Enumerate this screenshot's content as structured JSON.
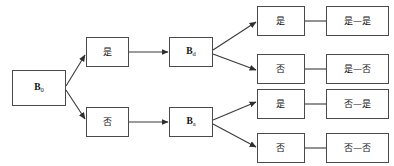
{
  "diagram": {
    "type": "binary-decision-tree",
    "title": "",
    "orientation": "left-to-right",
    "background_color": "#ffffff",
    "box_border_color": "#4a4a4a",
    "edge_color": "#3a3a3a",
    "text_color": "#111111",
    "nodes": {
      "root": {
        "id": "root",
        "base": "B",
        "subscript": "0",
        "label": "B0",
        "column": 1
      },
      "level1": [
        {
          "id": "l1-yes",
          "label": "是",
          "meaning": "yes",
          "column": 2
        },
        {
          "id": "l1-no",
          "label": "否",
          "meaning": "no",
          "column": 2
        }
      ],
      "level2": [
        {
          "id": "l2-upper",
          "base": "B",
          "subscript": "d",
          "label": "Bd",
          "column": 3
        },
        {
          "id": "l2-lower",
          "base": "B",
          "subscript": "a",
          "label": "Ba",
          "column": 3
        }
      ],
      "level3": [
        {
          "id": "l3-1",
          "label": "是",
          "meaning": "yes",
          "column": 4
        },
        {
          "id": "l3-2",
          "label": "否",
          "meaning": "no",
          "column": 4
        },
        {
          "id": "l3-3",
          "label": "是",
          "meaning": "yes",
          "column": 4
        },
        {
          "id": "l3-4",
          "label": "否",
          "meaning": "no",
          "column": 4
        }
      ],
      "outcomes": [
        {
          "id": "out-1",
          "label": "是—是",
          "column": 5
        },
        {
          "id": "out-2",
          "label": "是—否",
          "column": 5
        },
        {
          "id": "out-3",
          "label": "否—是",
          "column": 5
        },
        {
          "id": "out-4",
          "label": "否—否",
          "column": 5
        }
      ]
    },
    "edges": [
      {
        "from": "root",
        "to": "l1-yes",
        "style": "arrow",
        "direction": "diagonal-up"
      },
      {
        "from": "root",
        "to": "l1-no",
        "style": "arrow",
        "direction": "diagonal-down"
      },
      {
        "from": "l1-yes",
        "to": "l2-upper",
        "style": "arrow",
        "direction": "horizontal"
      },
      {
        "from": "l1-no",
        "to": "l2-lower",
        "style": "arrow",
        "direction": "horizontal"
      },
      {
        "from": "l2-upper",
        "to": "l3-1",
        "style": "arrow",
        "direction": "diagonal-up"
      },
      {
        "from": "l2-upper",
        "to": "l3-2",
        "style": "arrow",
        "direction": "diagonal-down"
      },
      {
        "from": "l2-lower",
        "to": "l3-3",
        "style": "arrow",
        "direction": "diagonal-up"
      },
      {
        "from": "l2-lower",
        "to": "l3-4",
        "style": "arrow",
        "direction": "diagonal-down"
      },
      {
        "from": "l3-1",
        "to": "out-1",
        "style": "line",
        "direction": "horizontal"
      },
      {
        "from": "l3-2",
        "to": "out-2",
        "style": "line",
        "direction": "horizontal"
      },
      {
        "from": "l3-3",
        "to": "out-3",
        "style": "line",
        "direction": "horizontal"
      },
      {
        "from": "l3-4",
        "to": "out-4",
        "style": "line",
        "direction": "horizontal"
      }
    ]
  }
}
